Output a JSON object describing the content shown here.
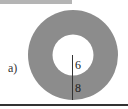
{
  "figure": {
    "part_label": "a)",
    "shape": "annulus",
    "inner_radius_label": "6",
    "ring_width_label": "8",
    "colors": {
      "ring_fill": "#8c8c8c",
      "hole_fill": "#ffffff",
      "line": "#333333",
      "top_bar": "#b4b4b4",
      "bottom_rule": "#333333"
    }
  }
}
